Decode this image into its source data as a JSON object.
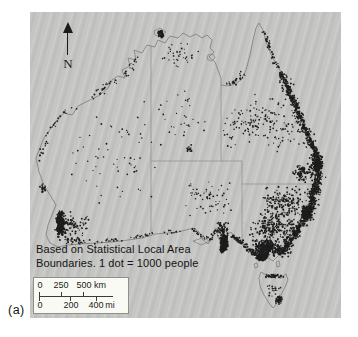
{
  "figure": {
    "label": "(a)"
  },
  "map": {
    "north_label": "N",
    "caption_line1": "Based on Statistical Local Area",
    "caption_line2": "Boundaries. 1 dot = 1000 people",
    "scale_bar": {
      "km_labels": [
        "0",
        "250",
        "500"
      ],
      "km_unit": "km",
      "mi_labels": [
        "0",
        "200",
        "400"
      ],
      "mi_unit": "mi"
    },
    "colors": {
      "panel_bg": "#c5c5c3",
      "coastline": "#85837e",
      "state_border": "#8f8d88",
      "dot": "#1d1d1d",
      "scale_bg": "#fafaf5",
      "text": "#141414"
    },
    "geometry": {
      "mainland": "M 6,146 L 14,126 L 24,112 L 34,101 L 42,103 L 48,94 L 60,88 L 70,83 L 78,76 L 82,68 L 88,64 L 95,66 L 92,58 L 100,54 L 98,46 L 106,48 L 104,38 L 112,41 L 117,33 L 125,35 L 128,28 L 135,31 L 140,24 L 148,26 L 153,21 L 160,25 L 166,22 L 172,26 L 177,23 L 182,28 L 180,36 L 184,40 L 179,45 L 185,50 L 188,58 L 191,66 L 191,73 L 198,74 L 205,72 L 211,68 L 216,58 L 220,43 L 223,28 L 226,16 L 229,11 L 233,18 L 236,30 L 240,40 L 244,48 L 250,58 L 254,66 L 258,76 L 263,88 L 268,100 L 273,112 L 278,124 L 283,136 L 288,146 L 292,154 L 290,164 L 287,174 L 284,184 L 281,194 L 276,204 L 270,214 L 263,224 L 256,234 L 250,242 L 243,249 L 237,245 L 233,249 L 228,245 L 222,240 L 215,234 L 207,230 L 201,220 L 194,225 L 191,231 L 188,225 L 186,216 L 183,224 L 178,232 L 173,228 L 169,220 L 163,216 L 156,218 L 148,220 L 138,221 L 125,222 L 112,226 L 98,228 L 82,230 L 66,231 L 50,232 L 38,233 L 28,235 L 20,231 L 16,223 L 18,213 L 22,203 L 26,193 L 20,183 L 14,173 L 9,160 Z",
      "tasmania": "M 231,260 L 238,264 L 245,262 L 251,265 L 256,262 L 258,268 L 255,275 L 251,283 L 247,291 L 243,296 L 239,291 L 234,283 L 230,274 L 229,266 Z",
      "islands": [
        "M 124,19 L 130,16 L 136,20 L 131,24 L 125,23 Z",
        "M 178,43 L 183,42 L 185,46 L 181,49 L 177,47 Z",
        "M 163,229 L 172,226 L 180,229 L 171,233 Z",
        "M 224,252 L 227,251 L 228,255 L 225,256 Z",
        "M 246,250 L 249,249 L 250,254 L 247,255 Z"
      ],
      "state_borders": [
        "M 121,34 L 121,223",
        "M 121,149 L 212,149",
        "M 191,73 L 191,149",
        "M 212,149 L 212,172 L 284,172",
        "M 212,172 L 212,230"
      ],
      "river_border": "M 212,210 L 236,224 L 258,236"
    },
    "dots": {
      "legend_value": "1 dot = 1000 people",
      "clusters": [
        {
          "name": "perth-core",
          "cx": 30,
          "cy": 212,
          "rx": 4,
          "ry": 13,
          "n": 150,
          "r": 1.1
        },
        {
          "name": "perth-halo",
          "cx": 34,
          "cy": 213,
          "rx": 10,
          "ry": 17,
          "n": 70,
          "r": 0.85
        },
        {
          "name": "geraldton",
          "cx": 13,
          "cy": 176,
          "rx": 3,
          "ry": 6,
          "n": 16,
          "r": 0.95
        },
        {
          "name": "wa-wheatbelt",
          "cx": 46,
          "cy": 214,
          "rx": 16,
          "ry": 12,
          "n": 55,
          "r": 0.8
        },
        {
          "name": "albany-coast",
          "cx": 44,
          "cy": 228,
          "rx": 12,
          "ry": 3,
          "n": 22,
          "r": 0.85
        },
        {
          "name": "wa-interior",
          "cx": 85,
          "cy": 140,
          "rx": 52,
          "ry": 62,
          "n": 65,
          "r": 0.75
        },
        {
          "name": "darwin",
          "cx": 131,
          "cy": 22,
          "rx": 3,
          "ry": 4,
          "n": 32,
          "r": 1.05
        },
        {
          "name": "top-end",
          "cx": 150,
          "cy": 44,
          "rx": 20,
          "ry": 14,
          "n": 38,
          "r": 0.75
        },
        {
          "name": "nt-interior",
          "cx": 152,
          "cy": 105,
          "rx": 26,
          "ry": 34,
          "n": 30,
          "r": 0.75
        },
        {
          "name": "alice-springs",
          "cx": 160,
          "cy": 136,
          "rx": 4,
          "ry": 4,
          "n": 12,
          "r": 0.9
        },
        {
          "name": "qld-interior",
          "cx": 240,
          "cy": 112,
          "rx": 36,
          "ry": 30,
          "n": 130,
          "r": 0.8
        },
        {
          "name": "qld-west",
          "cx": 205,
          "cy": 112,
          "rx": 18,
          "ry": 28,
          "n": 35,
          "r": 0.75
        },
        {
          "name": "sa-interior",
          "cx": 180,
          "cy": 186,
          "rx": 26,
          "ry": 20,
          "n": 60,
          "r": 0.75
        },
        {
          "name": "adelaide-core",
          "cx": 194,
          "cy": 231,
          "rx": 4,
          "ry": 10,
          "n": 150,
          "r": 1.1
        },
        {
          "name": "sa-midnorth",
          "cx": 192,
          "cy": 217,
          "rx": 7,
          "ry": 9,
          "n": 55,
          "r": 0.9
        },
        {
          "name": "vic-dense",
          "cx": 236,
          "cy": 236,
          "rx": 15,
          "ry": 9,
          "n": 300,
          "r": 0.95
        },
        {
          "name": "melbourne-core",
          "cx": 232,
          "cy": 245,
          "rx": 6,
          "ry": 4,
          "n": 110,
          "r": 1.1
        },
        {
          "name": "vic-nsw-inland",
          "cx": 243,
          "cy": 214,
          "rx": 24,
          "ry": 16,
          "n": 190,
          "r": 0.85
        },
        {
          "name": "nsw-inland",
          "cx": 253,
          "cy": 191,
          "rx": 22,
          "ry": 18,
          "n": 170,
          "r": 0.85
        },
        {
          "name": "sydney-core",
          "cx": 277,
          "cy": 201,
          "rx": 5,
          "ry": 8,
          "n": 150,
          "r": 1.1
        },
        {
          "name": "brisbane",
          "cx": 287,
          "cy": 152,
          "rx": 6,
          "ry": 9,
          "n": 170,
          "r": 1.0
        },
        {
          "name": "darling-downs",
          "cx": 272,
          "cy": 161,
          "rx": 11,
          "ry": 11,
          "n": 85,
          "r": 0.85
        },
        {
          "name": "tas-north",
          "cx": 243,
          "cy": 264,
          "rx": 11,
          "ry": 2.5,
          "n": 40,
          "r": 0.85
        },
        {
          "name": "hobart",
          "cx": 249,
          "cy": 288,
          "rx": 4,
          "ry": 5,
          "n": 30,
          "r": 0.9
        },
        {
          "name": "tas-scatter",
          "cx": 243,
          "cy": 277,
          "rx": 9,
          "ry": 10,
          "n": 22,
          "r": 0.75
        }
      ],
      "strips": [
        {
          "name": "qld-coast",
          "points": [
            [
              251,
              60
            ],
            [
              258,
              76
            ],
            [
              263,
              88
            ],
            [
              268,
              100
            ],
            [
              273,
              112
            ],
            [
              278,
              124
            ],
            [
              283,
              136
            ],
            [
              288,
              146
            ]
          ],
          "n": 260,
          "spread": 3.5,
          "r": 0.95
        },
        {
          "name": "qld-coast-halo",
          "points": [
            [
              251,
              60
            ],
            [
              258,
              76
            ],
            [
              263,
              88
            ],
            [
              268,
              100
            ],
            [
              273,
              112
            ],
            [
              278,
              124
            ],
            [
              283,
              136
            ],
            [
              288,
              146
            ]
          ],
          "n": 110,
          "spread": 8,
          "r": 0.8
        },
        {
          "name": "cape-york-east",
          "points": [
            [
              233,
              18
            ],
            [
              238,
              30
            ],
            [
              244,
              48
            ],
            [
              250,
              58
            ]
          ],
          "n": 40,
          "spread": 3,
          "r": 0.85
        },
        {
          "name": "nsw-coast",
          "points": [
            [
              290,
              160
            ],
            [
              286,
              174
            ],
            [
              281,
              194
            ],
            [
              274,
              208
            ],
            [
              266,
              220
            ],
            [
              258,
              231
            ],
            [
              249,
              243
            ]
          ],
          "n": 380,
          "spread": 4.5,
          "r": 0.95
        },
        {
          "name": "nsw-coast-halo",
          "points": [
            [
              290,
              160
            ],
            [
              286,
              174
            ],
            [
              281,
              194
            ],
            [
              274,
              208
            ],
            [
              266,
              220
            ],
            [
              258,
              231
            ],
            [
              249,
              243
            ]
          ],
          "n": 220,
          "spread": 10,
          "r": 0.8
        },
        {
          "name": "vic-west-coast",
          "points": [
            [
              228,
              245
            ],
            [
              216,
              235
            ],
            [
              203,
              223
            ]
          ],
          "n": 70,
          "spread": 3,
          "r": 0.9
        },
        {
          "name": "eyre-peninsula",
          "points": [
            [
              186,
              217
            ],
            [
              181,
              228
            ],
            [
              172,
              224
            ],
            [
              162,
              217
            ]
          ],
          "n": 35,
          "spread": 2.5,
          "r": 0.8
        },
        {
          "name": "bight-coast",
          "points": [
            [
              150,
              219
            ],
            [
              120,
              222
            ],
            [
              90,
              228
            ],
            [
              60,
              230
            ],
            [
              36,
              232
            ]
          ],
          "n": 50,
          "spread": 2.5,
          "r": 0.8
        },
        {
          "name": "west-coast",
          "points": [
            [
              8,
              150
            ],
            [
              20,
              118
            ],
            [
              34,
              100
            ],
            [
              48,
              93
            ]
          ],
          "n": 30,
          "spread": 3,
          "r": 0.8
        },
        {
          "name": "nw-coast",
          "points": [
            [
              60,
              87
            ],
            [
              80,
              70
            ],
            [
              95,
              65
            ],
            [
              108,
              44
            ]
          ],
          "n": 40,
          "spread": 4,
          "r": 0.8
        },
        {
          "name": "gulf-south-coast",
          "points": [
            [
              194,
              72
            ],
            [
              204,
              71
            ],
            [
              214,
              60
            ]
          ],
          "n": 25,
          "spread": 4,
          "r": 0.8
        }
      ]
    }
  }
}
